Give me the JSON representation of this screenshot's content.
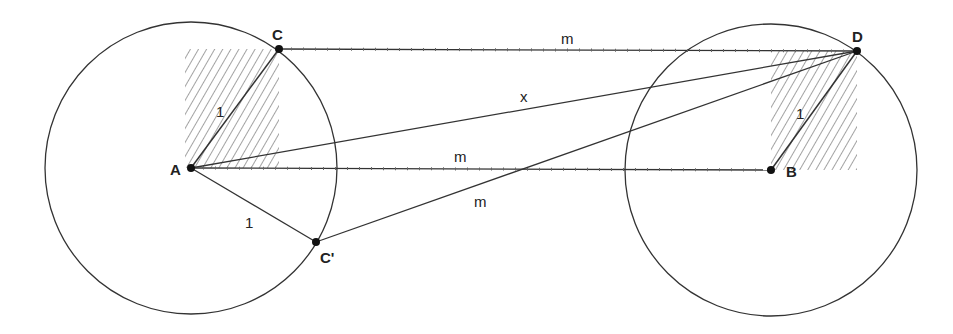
{
  "colors": {
    "stroke": "#333333",
    "hatch": "#555555",
    "point": "#111111",
    "background": "#ffffff"
  },
  "points": {
    "A": {
      "label": "A",
      "x": 191,
      "y": 168
    },
    "B": {
      "label": "B",
      "x": 771,
      "y": 170
    },
    "C": {
      "label": "C",
      "x": 279,
      "y": 49
    },
    "D": {
      "label": "D",
      "x": 857,
      "y": 51
    },
    "Cp": {
      "label": "C'",
      "x": 316,
      "y": 242
    }
  },
  "circles": [
    {
      "center": "A",
      "radius": 146
    },
    {
      "center": "B",
      "radius": 146
    }
  ],
  "segments": [
    {
      "from": "C",
      "to": "D",
      "style": "dashed",
      "label": "m"
    },
    {
      "from": "A",
      "to": "B",
      "style": "dashed",
      "label": "m"
    },
    {
      "from": "A",
      "to": "D",
      "style": "solid",
      "label": "x"
    },
    {
      "from": "Cp",
      "to": "D",
      "style": "solid",
      "label": "m"
    },
    {
      "from": "A",
      "to": "C",
      "style": "solid",
      "label": "1"
    },
    {
      "from": "A",
      "to": "Cp",
      "style": "solid",
      "label": "1"
    },
    {
      "from": "B",
      "to": "D",
      "style": "solid",
      "label": "1"
    }
  ],
  "hatched_regions": [
    {
      "x": 185,
      "y": 49,
      "w": 94,
      "h": 119
    },
    {
      "x": 771,
      "y": 51,
      "w": 86,
      "h": 119
    }
  ],
  "labels": {
    "A": "A",
    "B": "B",
    "C": "C",
    "D": "D",
    "Cp": "C'",
    "m_top": "m",
    "m_mid": "m",
    "m_diag": "m",
    "x": "x",
    "one_AC": "1",
    "one_ACp": "1",
    "one_BD": "1"
  }
}
